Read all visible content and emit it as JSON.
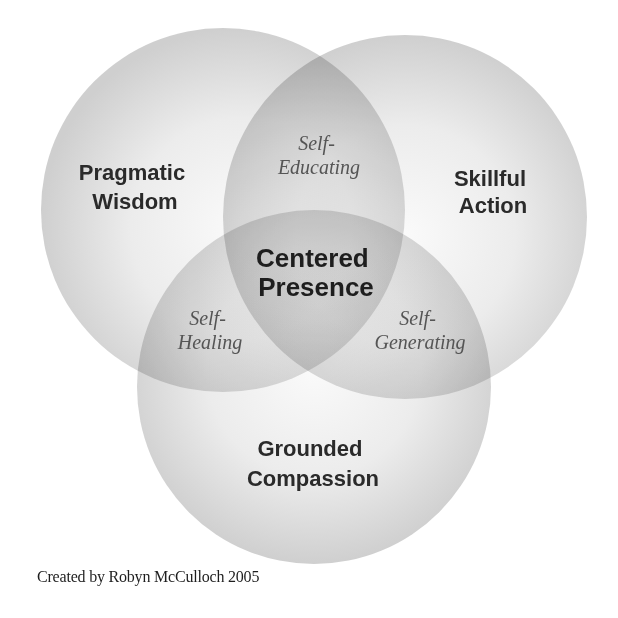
{
  "diagram": {
    "type": "venn",
    "sets": [
      {
        "id": "left",
        "lines": [
          "Pragmatic",
          "Wisdom"
        ]
      },
      {
        "id": "right",
        "lines": [
          "Skillful",
          "Action"
        ]
      },
      {
        "id": "bottom",
        "lines": [
          "Grounded",
          "Compassion"
        ]
      }
    ],
    "intersections": [
      {
        "sets": [
          "left",
          "right"
        ],
        "lines": [
          "Self-",
          "Educating"
        ]
      },
      {
        "sets": [
          "left",
          "bottom"
        ],
        "lines": [
          "Self-",
          "Healing"
        ]
      },
      {
        "sets": [
          "right",
          "bottom"
        ],
        "lines": [
          "Self-",
          "Generating"
        ]
      },
      {
        "sets": [
          "left",
          "right",
          "bottom"
        ],
        "lines": [
          "Centered",
          "Presence"
        ]
      }
    ],
    "colors": {
      "circle_center": "#fafafa",
      "circle_edge": "#cfcfcf",
      "label_bold": "#2a2a2a",
      "label_italic": "#555555"
    }
  },
  "caption": "Created by Robyn McCulloch 2005"
}
